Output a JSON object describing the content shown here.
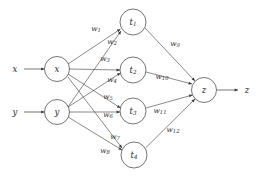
{
  "diagram": {
    "stroke_color": "#3a3a3a",
    "text_color": "#2a2a2a",
    "background_color": "#ffffff",
    "inputs": [
      {
        "id": "x",
        "label": "x",
        "cx": 57,
        "cy": 69,
        "r": 12.5
      },
      {
        "id": "y",
        "label": "y",
        "cx": 57,
        "cy": 112,
        "r": 12.5
      }
    ],
    "input_sources": [
      {
        "id": "src-x",
        "label": "x",
        "lx": 15,
        "ly": 69,
        "x1": 24,
        "y1": 69,
        "x2": 44.5,
        "y2": 69
      },
      {
        "id": "src-y",
        "label": "y",
        "lx": 15,
        "ly": 112,
        "x1": 24,
        "y1": 112,
        "x2": 44.5,
        "y2": 112
      }
    ],
    "hidden": [
      {
        "id": "t1",
        "label": "t",
        "subscript": "1",
        "cx": 133,
        "cy": 22,
        "r": 13
      },
      {
        "id": "t2",
        "label": "t",
        "subscript": "2",
        "cx": 133,
        "cy": 70,
        "r": 13
      },
      {
        "id": "t3",
        "label": "t",
        "subscript": "3",
        "cx": 133,
        "cy": 111,
        "r": 13
      },
      {
        "id": "t4",
        "label": "t",
        "subscript": "4",
        "cx": 134,
        "cy": 155,
        "r": 13
      }
    ],
    "output": {
      "id": "z",
      "label": "z",
      "cx": 204,
      "cy": 90,
      "r": 12.5
    },
    "output_sink": {
      "id": "sink-z",
      "label": "z",
      "lx": 247,
      "ly": 90,
      "x1": 217,
      "y1": 90,
      "x2": 238,
      "y2": 90
    },
    "edges_input_hidden": [
      {
        "id": "e-x-t1",
        "from": "x",
        "to": "t1",
        "weight": "w",
        "subscript": "1",
        "x1": 68,
        "y1": 64,
        "x2": 120.5,
        "y2": 29,
        "lx": 96,
        "ly": 28
      },
      {
        "id": "e-y-t1",
        "from": "y",
        "to": "t1",
        "weight": "w",
        "subscript": "2",
        "x1": 68,
        "y1": 107,
        "x2": 121,
        "y2": 31,
        "lx": 112,
        "ly": 41
      },
      {
        "id": "e-x-t2",
        "from": "x",
        "to": "t2",
        "weight": "w",
        "subscript": "3",
        "x1": 69.5,
        "y1": 69,
        "x2": 120,
        "y2": 70,
        "lx": 105,
        "ly": 58
      },
      {
        "id": "e-y-t2",
        "from": "y",
        "to": "t2",
        "weight": "w",
        "subscript": "4",
        "x1": 68,
        "y1": 107,
        "x2": 120.5,
        "y2": 73,
        "lx": 112,
        "ly": 79
      },
      {
        "id": "e-x-t3",
        "from": "x",
        "to": "t3",
        "weight": "w",
        "subscript": "5",
        "x1": 68,
        "y1": 74,
        "x2": 120.5,
        "y2": 108,
        "lx": 108,
        "ly": 96
      },
      {
        "id": "e-y-t3",
        "from": "y",
        "to": "t3",
        "weight": "w",
        "subscript": "6",
        "x1": 69.5,
        "y1": 112,
        "x2": 120,
        "y2": 112,
        "lx": 108,
        "ly": 114
      },
      {
        "id": "e-x-t4",
        "from": "x",
        "to": "t4",
        "weight": "w",
        "subscript": "7",
        "x1": 68,
        "y1": 77,
        "x2": 122,
        "y2": 148,
        "lx": 115,
        "ly": 136
      },
      {
        "id": "e-y-t4",
        "from": "y",
        "to": "t4",
        "weight": "w",
        "subscript": "8",
        "x1": 68,
        "y1": 117,
        "x2": 122,
        "y2": 150,
        "lx": 105,
        "ly": 150
      }
    ],
    "edges_hidden_output": [
      {
        "id": "e-t1-z",
        "from": "t1",
        "to": "z",
        "weight": "w",
        "subscript": "9",
        "x1": 145,
        "y1": 28,
        "x2": 195,
        "y2": 81,
        "lx": 175,
        "ly": 43
      },
      {
        "id": "e-t2-z",
        "from": "t2",
        "to": "z",
        "weight": "w",
        "subscript": "10",
        "x1": 146,
        "y1": 72,
        "x2": 192,
        "y2": 84,
        "lx": 162,
        "ly": 76
      },
      {
        "id": "e-t3-z",
        "from": "t3",
        "to": "z",
        "weight": "w",
        "subscript": "11",
        "x1": 146,
        "y1": 108,
        "x2": 192.5,
        "y2": 95,
        "lx": 160,
        "ly": 110
      },
      {
        "id": "e-t4-z",
        "from": "t4",
        "to": "z",
        "weight": "w",
        "subscript": "12",
        "x1": 145.5,
        "y1": 148,
        "x2": 195,
        "y2": 99,
        "lx": 173,
        "ly": 129
      }
    ]
  }
}
